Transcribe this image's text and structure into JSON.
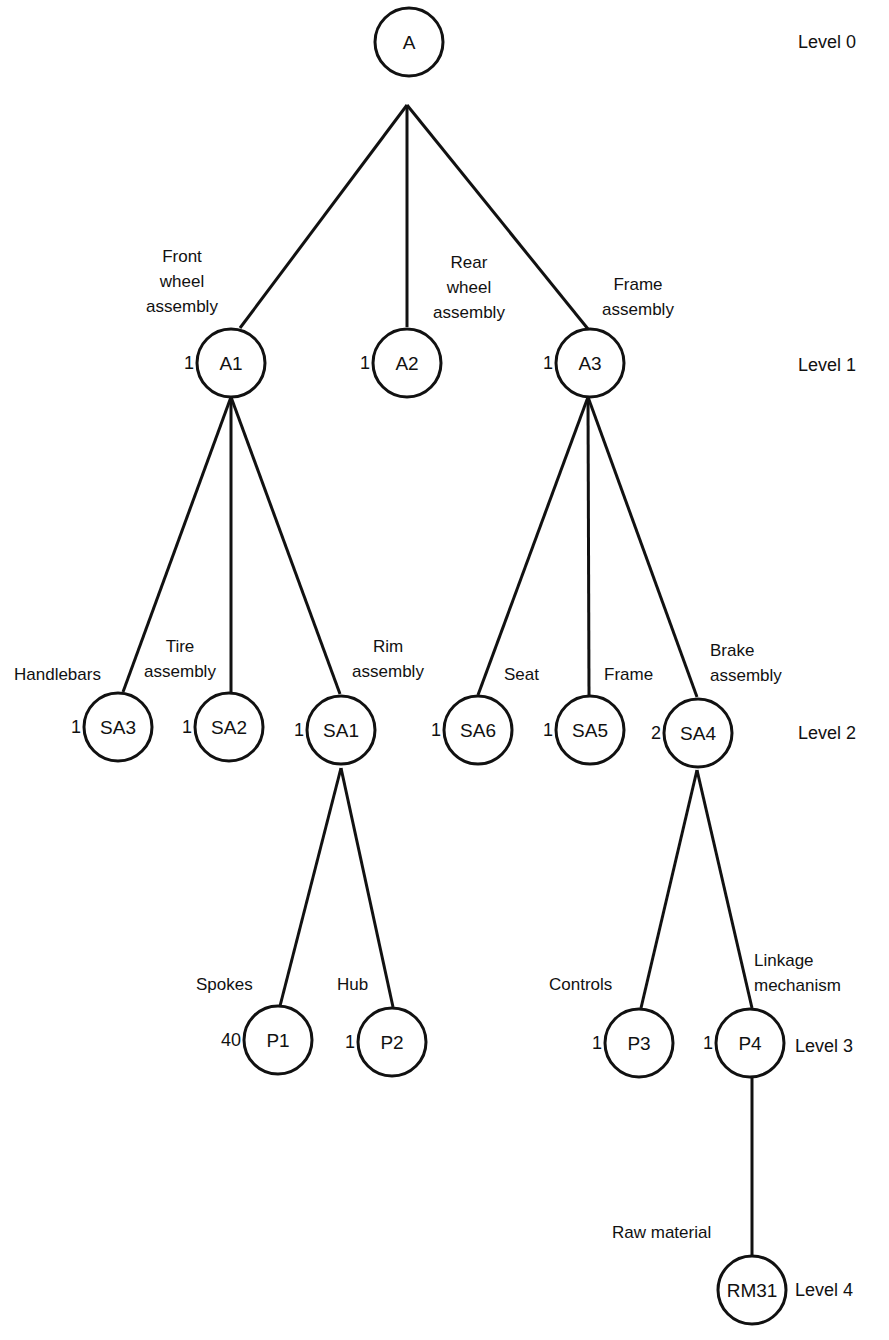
{
  "diagram": {
    "type": "product-structure-tree",
    "levels": [
      {
        "label": "Level 0",
        "x": 798,
        "y": 42
      },
      {
        "label": "Level 1",
        "x": 798,
        "y": 365
      },
      {
        "label": "Level 2",
        "x": 798,
        "y": 733
      },
      {
        "label": "Level 3",
        "x": 795,
        "y": 1046
      },
      {
        "label": "Level 4",
        "x": 795,
        "y": 1290
      }
    ],
    "nodes": [
      {
        "id": "A",
        "label": "A",
        "cx": 409,
        "cy": 42,
        "qty": "",
        "desc": []
      },
      {
        "id": "A1",
        "label": "A1",
        "cx": 231,
        "cy": 363,
        "qty": "1",
        "desc": [
          "Front",
          "wheel",
          "assembly"
        ],
        "desc_x": 182,
        "desc_y": 262,
        "desc_anchor": "middle"
      },
      {
        "id": "A2",
        "label": "A2",
        "cx": 407,
        "cy": 363,
        "qty": "1",
        "desc": [
          "Rear",
          "wheel",
          "assembly"
        ],
        "desc_x": 469,
        "desc_y": 268,
        "desc_anchor": "middle"
      },
      {
        "id": "A3",
        "label": "A3",
        "cx": 590,
        "cy": 363,
        "qty": "1",
        "desc": [
          "Frame",
          "assembly"
        ],
        "desc_x": 638,
        "desc_y": 290,
        "desc_anchor": "middle"
      },
      {
        "id": "SA3",
        "label": "SA3",
        "cx": 118,
        "cy": 727,
        "qty": "1",
        "desc": [
          "Handlebars"
        ],
        "desc_x": 14,
        "desc_y": 680,
        "desc_anchor": "start"
      },
      {
        "id": "SA2",
        "label": "SA2",
        "cx": 229,
        "cy": 727,
        "qty": "1",
        "desc": [
          "Tire",
          "assembly"
        ],
        "desc_x": 180,
        "desc_y": 652,
        "desc_anchor": "middle"
      },
      {
        "id": "SA1",
        "label": "SA1",
        "cx": 341,
        "cy": 730,
        "qty": "1",
        "desc": [
          "Rim",
          "assembly"
        ],
        "desc_x": 388,
        "desc_y": 652,
        "desc_anchor": "middle"
      },
      {
        "id": "SA6",
        "label": "SA6",
        "cx": 478,
        "cy": 730,
        "qty": "1",
        "desc": [
          "Seat"
        ],
        "desc_x": 504,
        "desc_y": 680,
        "desc_anchor": "start"
      },
      {
        "id": "SA5",
        "label": "SA5",
        "cx": 590,
        "cy": 730,
        "qty": "1",
        "desc": [
          "Frame"
        ],
        "desc_x": 604,
        "desc_y": 680,
        "desc_anchor": "start"
      },
      {
        "id": "SA4",
        "label": "SA4",
        "cx": 698,
        "cy": 733,
        "qty": "2",
        "desc": [
          "Brake",
          "assembly"
        ],
        "desc_x": 710,
        "desc_y": 656,
        "desc_anchor": "start"
      },
      {
        "id": "P1",
        "label": "P1",
        "cx": 278,
        "cy": 1040,
        "qty": "40",
        "desc": [
          "Spokes"
        ],
        "desc_x": 196,
        "desc_y": 990,
        "desc_anchor": "start"
      },
      {
        "id": "P2",
        "label": "P2",
        "cx": 392,
        "cy": 1042,
        "qty": "1",
        "desc": [
          "Hub"
        ],
        "desc_x": 337,
        "desc_y": 990,
        "desc_anchor": "start"
      },
      {
        "id": "P3",
        "label": "P3",
        "cx": 639,
        "cy": 1043,
        "qty": "1",
        "desc": [
          "Controls"
        ],
        "desc_x": 549,
        "desc_y": 990,
        "desc_anchor": "start"
      },
      {
        "id": "P4",
        "label": "P4",
        "cx": 750,
        "cy": 1043,
        "qty": "1",
        "desc": [
          "Linkage",
          "mechanism"
        ],
        "desc_x": 754,
        "desc_y": 966,
        "desc_anchor": "start"
      },
      {
        "id": "RM31",
        "label": "RM31",
        "cx": 752,
        "cy": 1290,
        "qty": "",
        "desc": [
          "Raw material"
        ],
        "desc_x": 612,
        "desc_y": 1238,
        "desc_anchor": "start"
      }
    ],
    "edges": [
      {
        "from": "A",
        "to": "A1",
        "x1": 407,
        "y1": 105,
        "x2": 240,
        "y2": 328
      },
      {
        "from": "A",
        "to": "A2",
        "x1": 407,
        "y1": 105,
        "x2": 407,
        "y2": 327
      },
      {
        "from": "A",
        "to": "A3",
        "x1": 407,
        "y1": 105,
        "x2": 588,
        "y2": 329
      },
      {
        "from": "A1",
        "to": "SA3",
        "x1": 231,
        "y1": 397,
        "x2": 123,
        "y2": 692
      },
      {
        "from": "A1",
        "to": "SA2",
        "x1": 231,
        "y1": 397,
        "x2": 231,
        "y2": 692
      },
      {
        "from": "A1",
        "to": "SA1",
        "x1": 231,
        "y1": 397,
        "x2": 340,
        "y2": 694
      },
      {
        "from": "A3",
        "to": "SA6",
        "x1": 588,
        "y1": 397,
        "x2": 478,
        "y2": 695
      },
      {
        "from": "A3",
        "to": "SA5",
        "x1": 588,
        "y1": 397,
        "x2": 589,
        "y2": 695
      },
      {
        "from": "A3",
        "to": "SA4",
        "x1": 588,
        "y1": 397,
        "x2": 697,
        "y2": 697
      },
      {
        "from": "SA1",
        "to": "P1",
        "x1": 341,
        "y1": 768,
        "x2": 280,
        "y2": 1006
      },
      {
        "from": "SA1",
        "to": "P2",
        "x1": 341,
        "y1": 768,
        "x2": 393,
        "y2": 1007
      },
      {
        "from": "SA4",
        "to": "P3",
        "x1": 697,
        "y1": 770,
        "x2": 641,
        "y2": 1008
      },
      {
        "from": "SA4",
        "to": "P4",
        "x1": 697,
        "y1": 770,
        "x2": 752,
        "y2": 1008
      },
      {
        "from": "P4",
        "to": "RM31",
        "x1": 752,
        "y1": 1077,
        "x2": 752,
        "y2": 1255
      }
    ]
  }
}
